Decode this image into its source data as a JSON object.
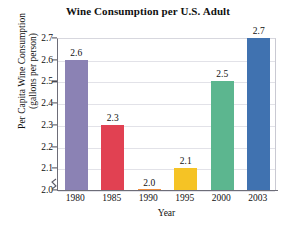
{
  "chart_data": {
    "type": "bar",
    "title": "Wine Consumption per U.S. Adult",
    "xlabel": "Year",
    "ylabel": "Per Capita Wine Consumption (gallons per person)",
    "ylabel_line1": "Per Capita Wine Consumption",
    "ylabel_line2": "(gallons per person)",
    "categories": [
      "1980",
      "1985",
      "1990",
      "1995",
      "2000",
      "2003"
    ],
    "values": [
      2.6,
      2.3,
      2.0,
      2.1,
      2.5,
      2.7
    ],
    "value_labels": [
      "2.6",
      "2.3",
      "2.0",
      "2.1",
      "2.5",
      "2.7"
    ],
    "bar_colors": [
      "#8b82b4",
      "#e14152",
      "#ee8c3c",
      "#f5c325",
      "#5cb68f",
      "#4072b0"
    ],
    "ylim": [
      2.0,
      2.7
    ],
    "ytick_labels": [
      "2.7",
      "2.6",
      "2.5",
      "2.4",
      "2.3",
      "2.2",
      "2.1",
      "2.0"
    ],
    "ytick_values": [
      2.7,
      2.6,
      2.5,
      2.4,
      2.3,
      2.2,
      2.1,
      2.0
    ],
    "grid": true,
    "grid_axis": "y",
    "legend": false,
    "axis_break": true,
    "axis_break_note": "zigzag break on y-axis below 2.0"
  }
}
